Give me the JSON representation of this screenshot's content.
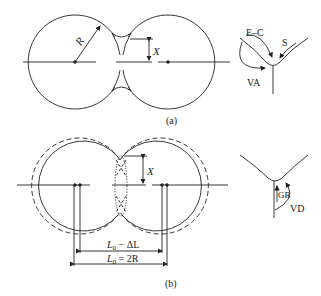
{
  "figure": {
    "panel_a": {
      "caption": "(a)",
      "radius_label": "R",
      "neck_label": "X",
      "mechanisms": {
        "evaporation_condensation": "E–C",
        "surface_diffusion": "S",
        "volume_diffusion_surface": "VA"
      }
    },
    "panel_b": {
      "caption": "(b)",
      "neck_label": "X",
      "dim_inner_L": "L",
      "dim_inner_sub": "0",
      "dim_inner_rest": " − ΔL",
      "dim_outer_L": "L",
      "dim_outer_sub": "0",
      "dim_outer_rest": " = 2R",
      "mechanisms": {
        "grain_boundary": "GB",
        "volume_diffusion_boundary": "VD"
      }
    }
  },
  "colors": {
    "line": "#222222",
    "background": "#ffffff"
  }
}
